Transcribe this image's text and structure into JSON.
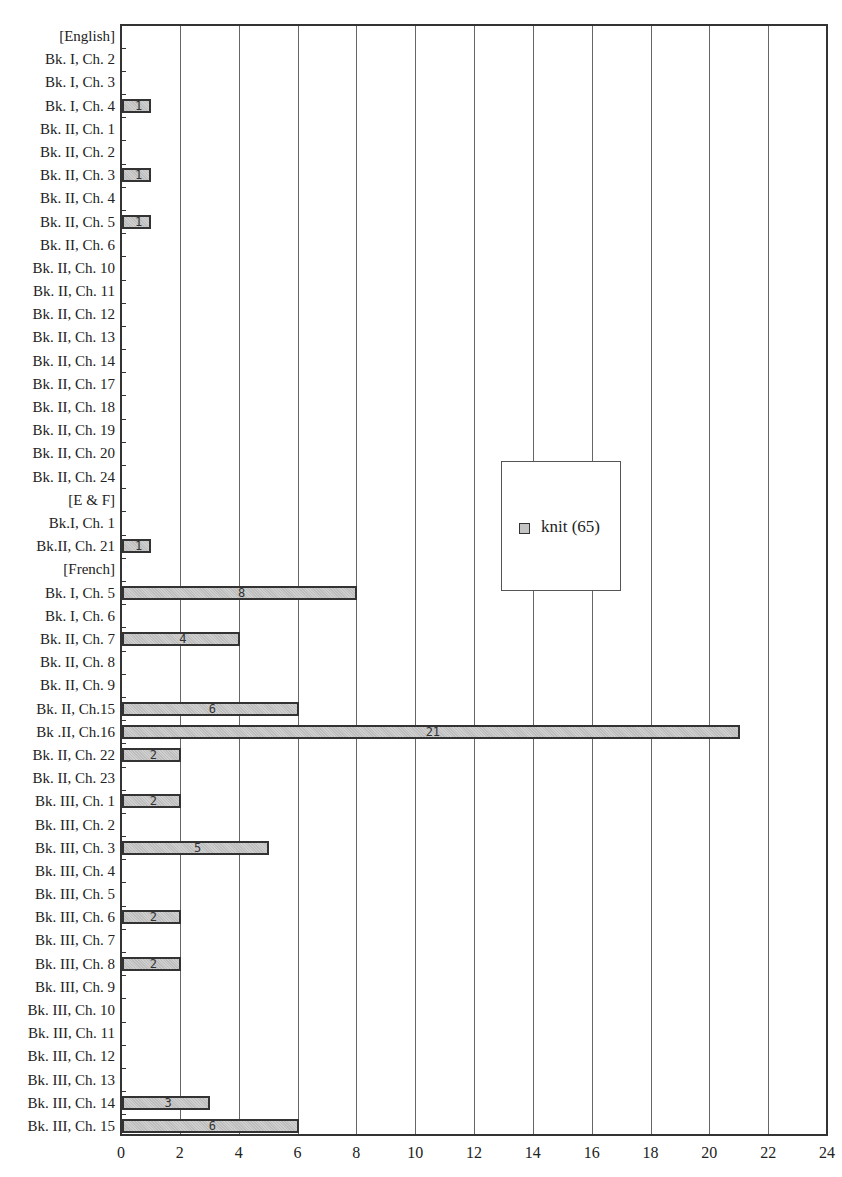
{
  "chart_data": {
    "type": "bar",
    "orientation": "horizontal",
    "title": "",
    "xlabel": "",
    "ylabel": "",
    "xlim": [
      0,
      24
    ],
    "x_ticks": [
      "0",
      "2",
      "4",
      "6",
      "8",
      "10",
      "12",
      "14",
      "16",
      "18",
      "20",
      "22",
      "24"
    ],
    "grid": "vertical",
    "legend_position": "inside-right-middle",
    "categories": [
      "[English]",
      "Bk. I, Ch. 2",
      "Bk. I, Ch. 3",
      "Bk. I, Ch. 4",
      "Bk. II, Ch. 1",
      "Bk. II, Ch. 2",
      "Bk. II, Ch. 3",
      "Bk. II, Ch. 4",
      "Bk. II, Ch. 5",
      "Bk. II, Ch. 6",
      "Bk. II, Ch. 10",
      "Bk. II, Ch. 11",
      "Bk. II, Ch. 12",
      "Bk. II, Ch. 13",
      "Bk. II, Ch. 14",
      "Bk. II, Ch. 17",
      "Bk. II, Ch. 18",
      "Bk. II, Ch. 19",
      "Bk. II, Ch. 20",
      "Bk. II, Ch. 24",
      "[E & F]",
      "Bk.I, Ch. 1",
      "Bk.II, Ch. 21",
      "[French]",
      "Bk. I, Ch. 5",
      "Bk. I, Ch. 6",
      "Bk. II, Ch. 7",
      "Bk. II, Ch. 8",
      "Bk. II, Ch. 9",
      "Bk. II, Ch.15",
      "Bk .II, Ch.16",
      "Bk. II, Ch. 22",
      "Bk. II, Ch. 23",
      "Bk. III, Ch. 1",
      "Bk. III, Ch. 2",
      "Bk. III, Ch. 3",
      "Bk. III, Ch. 4",
      "Bk. III, Ch. 5",
      "Bk. III, Ch. 6",
      "Bk. III, Ch. 7",
      "Bk. III, Ch. 8",
      "Bk. III, Ch. 9",
      "Bk. III, Ch. 10",
      "Bk. III, Ch. 11",
      "Bk. III, Ch. 12",
      "Bk. III, Ch. 13",
      "Bk. III, Ch. 14",
      "Bk. III, Ch. 15"
    ],
    "series": [
      {
        "name": "knit (65)",
        "color": "#c4c4c4",
        "values": [
          0,
          0,
          0,
          1,
          0,
          0,
          1,
          0,
          1,
          0,
          0,
          0,
          0,
          0,
          0,
          0,
          0,
          0,
          0,
          0,
          0,
          0,
          1,
          0,
          8,
          0,
          4,
          0,
          0,
          6,
          21,
          2,
          0,
          2,
          0,
          5,
          0,
          0,
          2,
          0,
          2,
          0,
          0,
          0,
          0,
          0,
          3,
          6
        ]
      }
    ],
    "data_labels": true
  },
  "legend": {
    "label": "knit (65)"
  }
}
